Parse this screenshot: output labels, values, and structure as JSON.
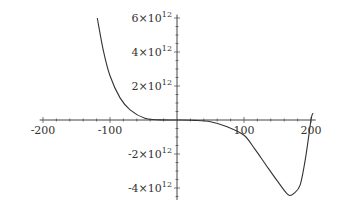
{
  "chart_data": {
    "type": "line",
    "title": "",
    "xlabel": "",
    "ylabel": "",
    "xlim": [
      -200,
      205
    ],
    "ylim": [
      -4600000000000.0,
      6200000000000.0
    ],
    "x_ticks": [
      -200,
      -100,
      100,
      200
    ],
    "x_tick_labels": [
      "-200",
      "-100",
      "100",
      "200"
    ],
    "y_ticks": [
      6000000000000.0,
      4000000000000.0,
      2000000000000.0,
      -2000000000000.0,
      -4000000000000.0
    ],
    "y_tick_labels": [
      {
        "mantissa": "6",
        "base": "10",
        "exp": "12"
      },
      {
        "mantissa": "4",
        "base": "10",
        "exp": "12"
      },
      {
        "mantissa": "2",
        "base": "10",
        "exp": "12"
      },
      {
        "mantissa": "-2",
        "base": "10",
        "exp": "12"
      },
      {
        "mantissa": "-4",
        "base": "10",
        "exp": "12"
      }
    ],
    "grid": false,
    "legend": null,
    "series": [
      {
        "name": "f(x)",
        "color": "#333333",
        "x": [
          -119,
          -110,
          -100,
          -85,
          -70,
          -48,
          -25,
          0,
          25,
          50,
          75,
          100,
          116,
          132,
          150,
          166,
          175,
          184,
          192,
          200,
          203
        ],
        "y": [
          6000000000000.0,
          4100000000000.0,
          2600000000000.0,
          1300000000000.0,
          600000000000.0,
          100000000000.0,
          10000000000.0,
          0,
          -20000000000.0,
          -100000000000.0,
          -400000000000.0,
          -900000000000.0,
          -1700000000000.0,
          -2600000000000.0,
          -3600000000000.0,
          -4400000000000.0,
          -4300000000000.0,
          -3800000000000.0,
          -2200000000000.0,
          0,
          400000000000.0
        ]
      }
    ]
  }
}
